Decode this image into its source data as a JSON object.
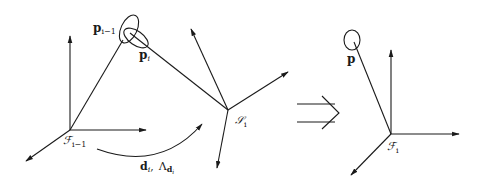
{
  "diagram": {
    "left": {
      "frame_prev_label": "ℱ",
      "frame_prev_sub": "i−1",
      "sensor_label": "𝒮",
      "sensor_sub": "i",
      "point_prev_label": "p",
      "point_prev_sub": "i−1",
      "point_curr_label": "p",
      "point_curr_sub": "i",
      "transform_label": "d",
      "transform_sub": "i",
      "transform_sep": ",",
      "covariance_label": "Λ",
      "covariance_sub": "d",
      "covariance_subsub": "i"
    },
    "implies_symbol": "⟹",
    "right": {
      "frame_label": "ℱ",
      "frame_sub": "i",
      "point_label": "p"
    }
  }
}
